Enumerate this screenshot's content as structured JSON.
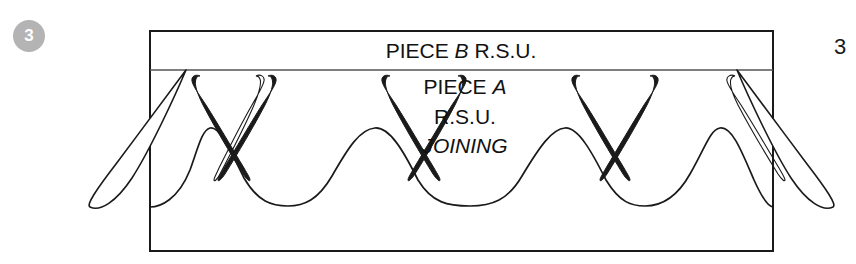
{
  "figure": {
    "step_badge": "3",
    "page_number": "3",
    "background_color": "#ffffff",
    "line_color": "#1a1a1a",
    "badge_color": "#b4b4b4",
    "badge_text_color": "#ffffff"
  },
  "labels": {
    "top_band": {
      "prefix": "PIECE ",
      "emphasis": "B",
      "suffix": " R.S.U."
    },
    "center": {
      "line1_prefix": "PIECE ",
      "line1_emphasis": "A",
      "line2": "R.S.U.",
      "line3": "JOINING"
    }
  },
  "geometry": {
    "box": {
      "left": 150,
      "top": 31,
      "right": 773,
      "bottom": 251
    },
    "divider_y": 70,
    "scallop": {
      "peaks_x": [
        210,
        375,
        565,
        720
      ],
      "valleys_x": [
        288,
        470,
        645
      ],
      "peak_y": 128,
      "valley_y": 205
    },
    "petal_tip_y": 75,
    "outer_petal_left_end": {
      "x": 90,
      "y": 207
    },
    "outer_petal_right_end": {
      "x": 815,
      "y": 207
    }
  }
}
